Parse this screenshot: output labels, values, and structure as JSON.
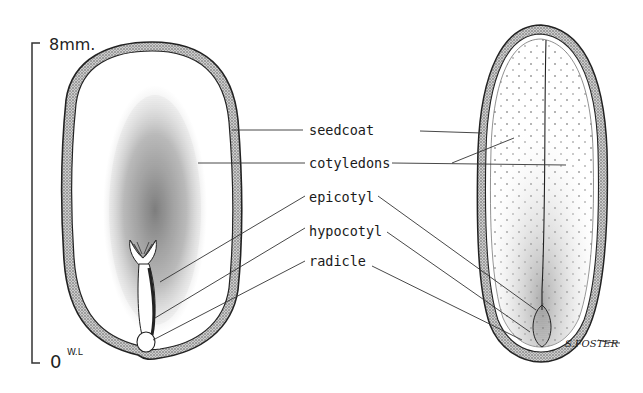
{
  "scale_bar": {
    "top_label": "8mm.",
    "bottom_label": "0",
    "initials": "W.L"
  },
  "labels": [
    {
      "id": "seedcoat",
      "text": "seedcoat"
    },
    {
      "id": "cotyledons",
      "text": "cotyledons"
    },
    {
      "id": "epicotyl",
      "text": "epicotyl"
    },
    {
      "id": "hypocotyl",
      "text": "hypocotyl"
    },
    {
      "id": "radicle",
      "text": "radicle"
    }
  ],
  "figures": {
    "left": "seed-edge-view",
    "right": "seed-face-view"
  },
  "signature": "S.FOSTER",
  "colors": {
    "ink": "#1a1a1a",
    "background": "#ffffff",
    "stipple": "#555555"
  }
}
